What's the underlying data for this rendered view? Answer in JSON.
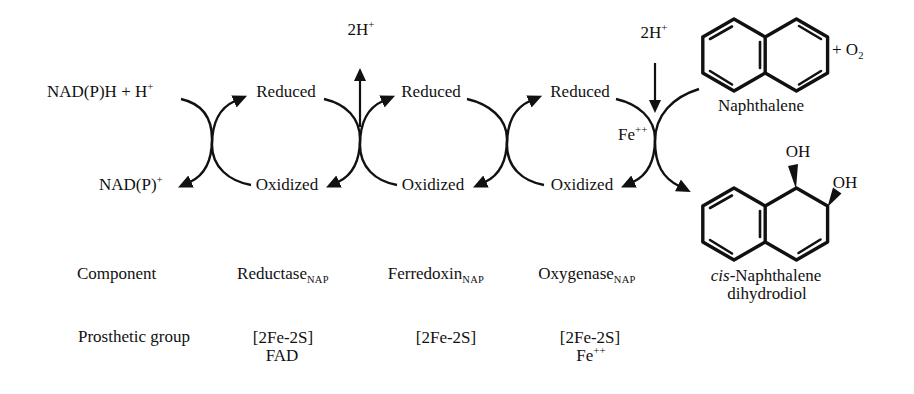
{
  "colors": {
    "ink": "#111111",
    "background": "#ffffff"
  },
  "electron_chain": {
    "nadph": {
      "base": "NAD(P)H + H",
      "sup": "+"
    },
    "nadp": {
      "base": "NAD(P)",
      "sup": "+"
    },
    "proton_release": {
      "base": "2H",
      "sup": "+"
    },
    "proton_uptake": {
      "base": "2H",
      "sup": "+"
    },
    "iron_site": {
      "base": "Fe",
      "sup": "++"
    },
    "cycles": [
      {
        "reduced": "Reduced",
        "oxidized": "Oxidized"
      },
      {
        "reduced": "Reduced",
        "oxidized": "Oxidized"
      },
      {
        "reduced": "Reduced",
        "oxidized": "Oxidized"
      }
    ]
  },
  "substrate": {
    "name": "Naphthalene",
    "cosubstrate": {
      "base": "+ O",
      "sub": "2"
    }
  },
  "product": {
    "hydroxyl_1": "OH",
    "hydroxyl_2": "OH",
    "name_italic": "cis",
    "name_rest": "-Naphthalene",
    "name_line2": "dihydrodiol"
  },
  "table": {
    "row_component": "Component",
    "row_prosthetic": "Prosthetic group",
    "columns": [
      {
        "name": "Reductase",
        "sub": "NAP",
        "group1": "[2Fe-2S]",
        "group2": "FAD"
      },
      {
        "name": "Ferredoxin",
        "sub": "NAP",
        "group1": "[2Fe-2S]"
      },
      {
        "name": "Oxygenase",
        "sub": "NAP",
        "group1": "[2Fe-2S]",
        "group2_base": "Fe",
        "group2_sup": "++"
      }
    ]
  }
}
